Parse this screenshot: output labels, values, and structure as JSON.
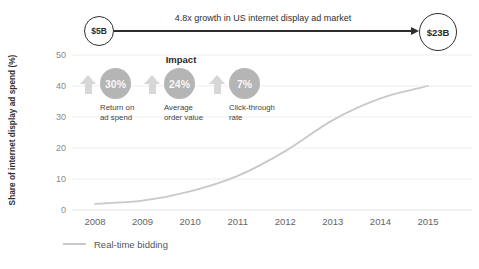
{
  "header": {
    "start_label": "$5B",
    "end_label": "$23B",
    "arrow_text": "4.8x growth in US internet display ad market"
  },
  "impact": {
    "title": "Impact",
    "items": [
      {
        "value": "30%",
        "label": "Return on\nad spend"
      },
      {
        "value": "24%",
        "label": "Average\norder value"
      },
      {
        "value": "7%",
        "label": "Click-through\nrate"
      }
    ]
  },
  "chart_data": {
    "type": "line",
    "x": [
      2008,
      2009,
      2010,
      2011,
      2012,
      2013,
      2014,
      2015
    ],
    "series": [
      {
        "name": "Real-time bidding",
        "values": [
          2,
          3,
          6,
          11,
          19,
          29,
          36,
          40
        ]
      }
    ],
    "title": "",
    "xlabel": "",
    "ylabel": "Share of internet display ad spend (%)",
    "ylim": [
      0,
      50
    ],
    "yticks": [
      0,
      10,
      20,
      30,
      40,
      50
    ],
    "grid": true,
    "legend_position": "bottom-left",
    "colors": {
      "line": "#c9c9c9",
      "grid": "#ededed",
      "axis_line": "#e2e2e2",
      "annotation": "#2e2e2e",
      "impact_circle": "#b5b5b5",
      "impact_arrow": "#d7d7d7"
    }
  }
}
